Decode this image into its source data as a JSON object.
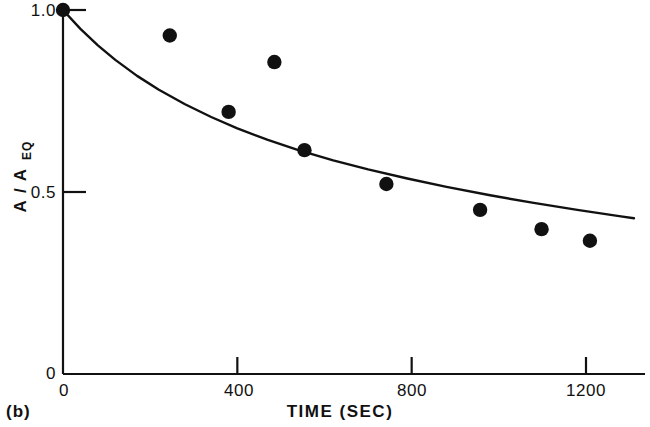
{
  "chart_data": {
    "type": "scatter",
    "title": "",
    "panel_label": "(b)",
    "xlabel": "TIME  (SEC)",
    "ylabel": "A / A",
    "ylabel_subscript": "EQ",
    "xlim": [
      0,
      1310
    ],
    "ylim": [
      0,
      1.03
    ],
    "grid": false,
    "legend": null,
    "x_ticks": [
      0,
      400,
      800,
      1200
    ],
    "x_tick_labels": [
      "0",
      "400",
      "800",
      "1200"
    ],
    "y_ticks": [
      0,
      0.5,
      1.0
    ],
    "y_tick_labels": [
      "0",
      "0.5",
      "1.0"
    ],
    "series": [
      {
        "name": "measured",
        "type": "scatter",
        "marker": "filled-circle",
        "color": "#111111",
        "points": [
          {
            "x": 0,
            "y": 1.0
          },
          {
            "x": 245,
            "y": 0.93
          },
          {
            "x": 485,
            "y": 0.857
          },
          {
            "x": 380,
            "y": 0.72
          },
          {
            "x": 554,
            "y": 0.615
          },
          {
            "x": 742,
            "y": 0.522
          },
          {
            "x": 957,
            "y": 0.451
          },
          {
            "x": 1098,
            "y": 0.398
          },
          {
            "x": 1209,
            "y": 0.366
          }
        ]
      },
      {
        "name": "fitted-curve",
        "type": "line",
        "color": "#111111",
        "points": [
          {
            "x": 0,
            "y": 1.0
          },
          {
            "x": 40,
            "y": 0.948
          },
          {
            "x": 80,
            "y": 0.903
          },
          {
            "x": 120,
            "y": 0.863
          },
          {
            "x": 170,
            "y": 0.819
          },
          {
            "x": 220,
            "y": 0.781
          },
          {
            "x": 280,
            "y": 0.741
          },
          {
            "x": 340,
            "y": 0.706
          },
          {
            "x": 400,
            "y": 0.675
          },
          {
            "x": 470,
            "y": 0.643
          },
          {
            "x": 540,
            "y": 0.615
          },
          {
            "x": 620,
            "y": 0.587
          },
          {
            "x": 700,
            "y": 0.562
          },
          {
            "x": 790,
            "y": 0.537
          },
          {
            "x": 880,
            "y": 0.514
          },
          {
            "x": 980,
            "y": 0.491
          },
          {
            "x": 1080,
            "y": 0.47
          },
          {
            "x": 1180,
            "y": 0.451
          },
          {
            "x": 1280,
            "y": 0.433
          },
          {
            "x": 1310,
            "y": 0.428
          }
        ]
      }
    ]
  },
  "colors": {
    "ink": "#111111",
    "background": "#ffffff"
  }
}
